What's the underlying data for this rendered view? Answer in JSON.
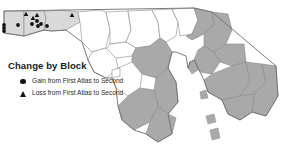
{
  "figure": {
    "kind": "choropleth-point-map",
    "region_name": "Maryland",
    "background_color": "#ffffff"
  },
  "legend": {
    "title": "Change by Block",
    "items": [
      {
        "marker": "filled-circle",
        "marker_color": "#141414",
        "label": "Gain from First Atlas to Second"
      },
      {
        "marker": "filled-triangle",
        "marker_color": "#141414",
        "label": "Loss from First Atlas to Second"
      }
    ]
  },
  "map_style": {
    "shaded_county_fill": "#a9a9a9",
    "unshaded_county_fill": "#ffffff",
    "county_border_color": "#8a8a8a",
    "state_border_color": "#6e6e6e",
    "water_fill": "#ffffff"
  },
  "markers": {
    "gain": [
      {
        "x": 4,
        "y": 25
      },
      {
        "x": 4,
        "y": 28
      },
      {
        "x": 4,
        "y": 31
      },
      {
        "x": 18,
        "y": 25
      },
      {
        "x": 32,
        "y": 24
      },
      {
        "x": 37,
        "y": 21
      },
      {
        "x": 38,
        "y": 26
      },
      {
        "x": 41,
        "y": 24
      },
      {
        "x": 47,
        "y": 26
      }
    ],
    "loss": [
      {
        "x": 26,
        "y": 14
      },
      {
        "x": 33,
        "y": 18
      },
      {
        "x": 37,
        "y": 15
      },
      {
        "x": 72,
        "y": 15
      }
    ]
  }
}
